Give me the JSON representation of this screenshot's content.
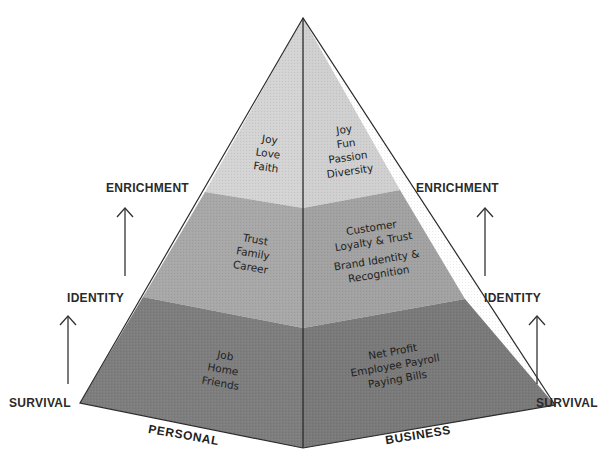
{
  "diagram": {
    "title": "",
    "colors": {
      "top_band": "#d4d4d4",
      "middle_band": "#a6a6a6",
      "bottom_band": "#7c7c7c",
      "outline": "#2b2b2b",
      "text": "#222222"
    },
    "levels_left": {
      "enrichment": "ENRICHMENT",
      "identity": "IDENTITY",
      "survival": "SURVIVAL"
    },
    "levels_right": {
      "enrichment": "ENRICHMENT",
      "identity": "IDENTITY",
      "survival": "SURVIVAL"
    },
    "faces": {
      "personal": {
        "label": "PERSONAL",
        "top": [
          "Joy",
          "Love",
          "Faith"
        ],
        "middle": [
          "Trust",
          "Family",
          "Career"
        ],
        "bottom": [
          "Job",
          "Home",
          "Friends"
        ]
      },
      "business": {
        "label": "BUSINESS",
        "top": [
          "Joy",
          "Fun",
          "Passion",
          "Diversity"
        ],
        "middle": [
          "Customer",
          "Loyalty & Trust",
          "Brand Identity &",
          "Recognition"
        ],
        "bottom": [
          "Net Profit",
          "Employee Payroll",
          "Paying Bills"
        ]
      }
    }
  }
}
